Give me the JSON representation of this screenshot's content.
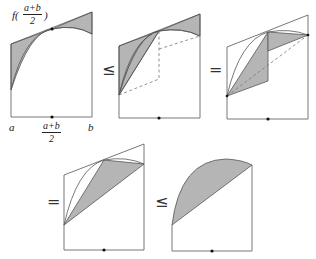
{
  "labels": {
    "f_prefix": "f(",
    "f_suffix": ")",
    "mid_num": "a+b",
    "mid_den": "2",
    "a": "a",
    "b": "b"
  },
  "relations": [
    "≤",
    "=",
    "=",
    "≤"
  ],
  "colors": {
    "shade": "#b5b5b5",
    "stroke": "#555555",
    "dashed": "#777777",
    "dot": "#111111"
  },
  "panels": [
    {
      "id": 1,
      "description": "concave curve with tangent line at midpoint; shaded regions between tangent and curve"
    },
    {
      "id": 2,
      "description": "shaded tangent regions plus left triangle; dashed reflection lines"
    },
    {
      "id": 3,
      "description": "rearranged shaded parallelogram region with dashed chord"
    },
    {
      "id": 4,
      "description": "shaded triangle between chord and midpoint"
    },
    {
      "id": 5,
      "description": "shaded region between curve and chord"
    }
  ]
}
